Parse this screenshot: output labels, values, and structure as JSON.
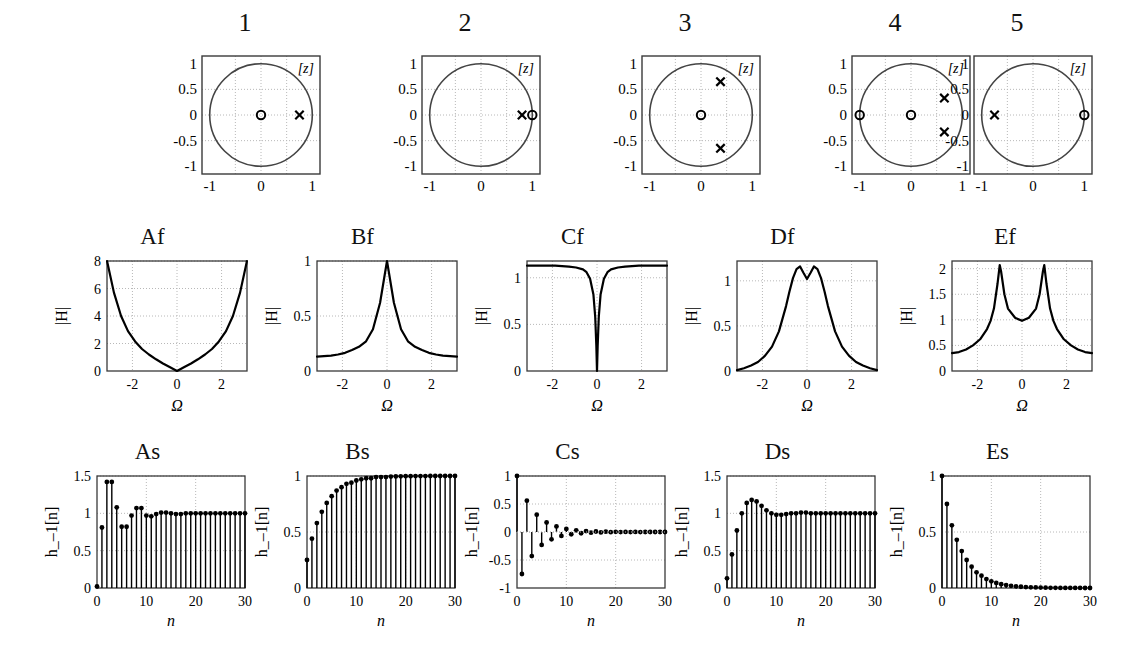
{
  "figure": {
    "rows": 3,
    "columns": 5
  },
  "row1": {
    "kind": "pole-zero",
    "axis": {
      "xticks": [
        "-1",
        "0",
        "1"
      ],
      "yticks": [
        "1",
        "0.5",
        "0",
        "-0.5",
        "-1"
      ],
      "plane_label": "[z]",
      "xlim": [
        -1.15,
        1.15
      ],
      "ylim": [
        -1.15,
        1.15
      ],
      "unit_circle": true,
      "grid": true
    },
    "panels": [
      {
        "title": "1",
        "zeros": [
          [
            0,
            0
          ]
        ],
        "poles": [
          [
            0.75,
            0
          ]
        ]
      },
      {
        "title": "2",
        "zeros": [
          [
            1.0,
            0
          ]
        ],
        "poles": [
          [
            0.8,
            0
          ]
        ]
      },
      {
        "title": "3",
        "zeros": [
          [
            0,
            0
          ]
        ],
        "poles": [
          [
            0.38,
            0.65
          ],
          [
            0.38,
            -0.65
          ]
        ]
      },
      {
        "title": "4",
        "zeros": [
          [
            -1.0,
            0
          ],
          [
            0,
            0
          ]
        ],
        "poles": [
          [
            0.65,
            0.33
          ],
          [
            0.65,
            -0.33
          ]
        ]
      },
      {
        "title": "5",
        "zeros": [
          [
            1.0,
            0
          ]
        ],
        "poles": [
          [
            -0.75,
            0
          ]
        ]
      }
    ]
  },
  "row2": {
    "kind": "magnitude-response",
    "ylabel": "|H|",
    "xlabel": "Ω",
    "xticks": [
      "-2",
      "0",
      "2"
    ],
    "xlim": [
      -3.1416,
      3.1416
    ],
    "panels": [
      {
        "title": "Af",
        "yticks": [
          "0",
          "2",
          "4",
          "6",
          "8"
        ],
        "ylim": [
          0,
          8
        ],
        "shape": "highpass",
        "chart_data": {
          "type": "line",
          "title": "Af",
          "xlabel": "Ω",
          "ylabel": "|H|",
          "xlim": [
            -3.1416,
            3.1416
          ],
          "ylim": [
            0,
            8
          ],
          "x": [
            -3.14,
            -2.83,
            -2.51,
            -2.2,
            -1.88,
            -1.57,
            -1.26,
            -0.94,
            -0.63,
            -0.31,
            0,
            0.31,
            0.63,
            0.94,
            1.26,
            1.57,
            1.88,
            2.2,
            2.51,
            2.83,
            3.14
          ],
          "y": [
            8.0,
            5.7,
            4.0,
            2.9,
            2.15,
            1.6,
            1.2,
            0.85,
            0.55,
            0.27,
            0.0,
            0.27,
            0.55,
            0.85,
            1.2,
            1.6,
            2.15,
            2.9,
            4.0,
            5.7,
            8.0
          ]
        }
      },
      {
        "title": "Bf",
        "yticks": [
          "0",
          "0.5",
          "1"
        ],
        "ylim": [
          0,
          1
        ],
        "shape": "lowpass",
        "chart_data": {
          "type": "line",
          "title": "Bf",
          "xlabel": "Ω",
          "ylabel": "|H|",
          "xlim": [
            -3.1416,
            3.1416
          ],
          "ylim": [
            0,
            1
          ],
          "x": [
            -3.14,
            -2.83,
            -2.51,
            -2.2,
            -1.88,
            -1.57,
            -1.26,
            -0.94,
            -0.63,
            -0.31,
            0,
            0.31,
            0.63,
            0.94,
            1.26,
            1.57,
            1.88,
            2.2,
            2.51,
            2.83,
            3.14
          ],
          "y": [
            0.13,
            0.135,
            0.14,
            0.15,
            0.165,
            0.19,
            0.22,
            0.27,
            0.38,
            0.62,
            1.0,
            0.62,
            0.38,
            0.27,
            0.22,
            0.19,
            0.165,
            0.15,
            0.14,
            0.135,
            0.13
          ]
        }
      },
      {
        "title": "Cf",
        "yticks": [
          "0",
          "0.5",
          "1"
        ],
        "ylim": [
          0,
          1.18
        ],
        "shape": "notch",
        "chart_data": {
          "type": "line",
          "title": "Cf",
          "xlabel": "Ω",
          "ylabel": "|H|",
          "xlim": [
            -3.1416,
            3.1416
          ],
          "ylim": [
            0,
            1.18
          ],
          "x": [
            -3.14,
            -2.51,
            -1.88,
            -1.26,
            -0.94,
            -0.63,
            -0.47,
            -0.31,
            -0.16,
            -0.08,
            -0.03,
            0,
            0.03,
            0.08,
            0.16,
            0.31,
            0.47,
            0.63,
            0.94,
            1.26,
            1.88,
            2.51,
            3.14
          ],
          "y": [
            1.13,
            1.13,
            1.13,
            1.12,
            1.11,
            1.09,
            1.06,
            0.99,
            0.82,
            0.58,
            0.27,
            0.0,
            0.27,
            0.58,
            0.82,
            0.99,
            1.06,
            1.09,
            1.11,
            1.12,
            1.13,
            1.13,
            1.13
          ]
        }
      },
      {
        "title": "Df",
        "yticks": [
          "0",
          "0.5",
          "1"
        ],
        "ylim": [
          0,
          1.22
        ],
        "shape": "bandpass-double",
        "chart_data": {
          "type": "line",
          "title": "Df",
          "xlabel": "Ω",
          "ylabel": "|H|",
          "xlim": [
            -3.1416,
            3.1416
          ],
          "ylim": [
            0,
            1.22
          ],
          "x": [
            -3.14,
            -2.83,
            -2.51,
            -2.2,
            -1.88,
            -1.57,
            -1.26,
            -0.94,
            -0.79,
            -0.63,
            -0.47,
            -0.31,
            -0.16,
            0,
            0.16,
            0.31,
            0.47,
            0.63,
            0.79,
            0.94,
            1.26,
            1.57,
            1.88,
            2.2,
            2.51,
            2.83,
            3.14
          ],
          "y": [
            0.01,
            0.03,
            0.06,
            0.1,
            0.17,
            0.27,
            0.44,
            0.72,
            0.88,
            1.03,
            1.13,
            1.16,
            1.09,
            1.02,
            1.09,
            1.16,
            1.13,
            1.03,
            0.88,
            0.72,
            0.44,
            0.27,
            0.17,
            0.1,
            0.06,
            0.03,
            0.01
          ]
        }
      },
      {
        "title": "Ef",
        "yticks": [
          "0",
          "0.5",
          "1",
          "1.5",
          "2"
        ],
        "ylim": [
          0,
          2.15
        ],
        "shape": "twin-peak",
        "chart_data": {
          "type": "line",
          "title": "Ef",
          "xlabel": "Ω",
          "ylabel": "|H|",
          "xlim": [
            -3.1416,
            3.1416
          ],
          "ylim": [
            0,
            2.15
          ],
          "x": [
            -3.14,
            -2.83,
            -2.51,
            -2.2,
            -1.88,
            -1.57,
            -1.41,
            -1.26,
            -1.1,
            -1.0,
            -0.94,
            -0.79,
            -0.63,
            -0.31,
            0,
            0.31,
            0.63,
            0.79,
            0.94,
            1.0,
            1.1,
            1.26,
            1.41,
            1.57,
            1.88,
            2.2,
            2.51,
            2.83,
            3.14
          ],
          "y": [
            0.35,
            0.37,
            0.42,
            0.5,
            0.62,
            0.82,
            0.98,
            1.22,
            1.7,
            2.07,
            1.95,
            1.5,
            1.22,
            1.04,
            0.98,
            1.04,
            1.22,
            1.5,
            1.95,
            2.07,
            1.7,
            1.22,
            0.98,
            0.82,
            0.62,
            0.5,
            0.42,
            0.37,
            0.35
          ]
        }
      }
    ]
  },
  "row3": {
    "kind": "step-response-stem",
    "ylabel": "h_–1[n]",
    "xlabel": "n",
    "xticks": [
      "0",
      "10",
      "20",
      "30"
    ],
    "xlim": [
      0,
      30
    ],
    "panels": [
      {
        "title": "As",
        "yticks": [
          "0",
          "0.5",
          "1",
          "1.5"
        ],
        "ylim": [
          0,
          1.5
        ],
        "chart_data": {
          "type": "stem",
          "title": "As",
          "xlabel": "n",
          "ylabel": "h_–1[n]",
          "xlim": [
            0,
            30
          ],
          "ylim": [
            0,
            1.5
          ],
          "x": [
            0,
            1,
            2,
            3,
            4,
            5,
            6,
            7,
            8,
            9,
            10,
            11,
            12,
            13,
            14,
            15,
            16,
            17,
            18,
            19,
            20,
            21,
            22,
            23,
            24,
            25,
            26,
            27,
            28,
            29,
            30
          ],
          "y": [
            0.02,
            0.81,
            1.42,
            1.42,
            1.08,
            0.82,
            0.82,
            0.97,
            1.07,
            1.07,
            0.97,
            0.96,
            0.99,
            1.01,
            1.01,
            1.0,
            0.99,
            0.99,
            1.0,
            1.0,
            1.0,
            1.0,
            1.0,
            1.0,
            1.0,
            1.0,
            1.0,
            1.0,
            1.0,
            1.0,
            1.0
          ]
        }
      },
      {
        "title": "Bs",
        "yticks": [
          "0",
          "0.5",
          "1"
        ],
        "ylim": [
          0,
          1.0
        ],
        "chart_data": {
          "type": "stem",
          "title": "Bs",
          "xlabel": "n",
          "ylabel": "h_–1[n]",
          "xlim": [
            0,
            30
          ],
          "ylim": [
            0,
            1.0
          ],
          "x": [
            0,
            1,
            2,
            3,
            4,
            5,
            6,
            7,
            8,
            9,
            10,
            11,
            12,
            13,
            14,
            15,
            16,
            17,
            18,
            19,
            20,
            21,
            22,
            23,
            24,
            25,
            26,
            27,
            28,
            29,
            30
          ],
          "y": [
            0.25,
            0.44,
            0.58,
            0.68,
            0.76,
            0.82,
            0.87,
            0.9,
            0.93,
            0.94,
            0.96,
            0.97,
            0.98,
            0.98,
            0.99,
            0.99,
            0.99,
            0.995,
            0.996,
            0.997,
            0.998,
            0.998,
            0.999,
            0.999,
            0.999,
            1.0,
            1.0,
            1.0,
            1.0,
            1.0,
            1.0
          ]
        }
      },
      {
        "title": "Cs",
        "yticks": [
          "-1",
          "-0.5",
          "0",
          "0.5",
          "1"
        ],
        "ylim": [
          -1,
          1
        ],
        "chart_data": {
          "type": "stem",
          "title": "Cs",
          "xlabel": "n",
          "ylabel": "h_–1[n]",
          "xlim": [
            0,
            30
          ],
          "ylim": [
            -1,
            1
          ],
          "x": [
            0,
            1,
            2,
            3,
            4,
            5,
            6,
            7,
            8,
            9,
            10,
            11,
            12,
            13,
            14,
            15,
            16,
            17,
            18,
            19,
            20,
            21,
            22,
            23,
            24,
            25,
            26,
            27,
            28,
            29,
            30
          ],
          "y": [
            1.0,
            -0.75,
            0.56,
            -0.43,
            0.31,
            -0.23,
            0.17,
            -0.13,
            0.1,
            -0.07,
            0.055,
            -0.04,
            0.03,
            -0.022,
            0.017,
            -0.012,
            0.009,
            -0.007,
            0.005,
            -0.004,
            0.003,
            -0.002,
            0.002,
            -0.001,
            0.001,
            -0.001,
            0.0,
            0.0,
            0.0,
            0.0,
            0.0
          ]
        }
      },
      {
        "title": "Ds",
        "yticks": [
          "0",
          "0.5",
          "1",
          "1.5"
        ],
        "ylim": [
          0,
          1.5
        ],
        "chart_data": {
          "type": "stem",
          "title": "Ds",
          "xlabel": "n",
          "ylabel": "h_–1[n]",
          "xlim": [
            0,
            30
          ],
          "ylim": [
            0,
            1.5
          ],
          "x": [
            0,
            1,
            2,
            3,
            4,
            5,
            6,
            7,
            8,
            9,
            10,
            11,
            12,
            13,
            14,
            15,
            16,
            17,
            18,
            19,
            20,
            21,
            22,
            23,
            24,
            25,
            26,
            27,
            28,
            29,
            30
          ],
          "y": [
            0.13,
            0.45,
            0.77,
            1.0,
            1.14,
            1.18,
            1.16,
            1.1,
            1.04,
            1.0,
            0.98,
            0.98,
            0.99,
            1.0,
            1.0,
            1.01,
            1.01,
            1.0,
            1.0,
            1.0,
            1.0,
            1.0,
            1.0,
            1.0,
            1.0,
            1.0,
            1.0,
            1.0,
            1.0,
            1.0,
            1.0
          ]
        }
      },
      {
        "title": "Es",
        "yticks": [
          "0",
          "0.5",
          "1"
        ],
        "ylim": [
          0,
          1.0
        ],
        "chart_data": {
          "type": "stem",
          "title": "Es",
          "xlabel": "n",
          "ylabel": "h_–1[n]",
          "xlim": [
            0,
            30
          ],
          "ylim": [
            0,
            1.0
          ],
          "x": [
            0,
            1,
            2,
            3,
            4,
            5,
            6,
            7,
            8,
            9,
            10,
            11,
            12,
            13,
            14,
            15,
            16,
            17,
            18,
            19,
            20,
            21,
            22,
            23,
            24,
            25,
            26,
            27,
            28,
            29,
            30
          ],
          "y": [
            1.0,
            0.75,
            0.56,
            0.43,
            0.33,
            0.25,
            0.19,
            0.14,
            0.11,
            0.08,
            0.06,
            0.045,
            0.034,
            0.026,
            0.019,
            0.015,
            0.011,
            0.008,
            0.006,
            0.005,
            0.004,
            0.003,
            0.002,
            0.0015,
            0.001,
            0.001,
            0.001,
            0.0005,
            0.0005,
            0.0,
            0.0
          ]
        }
      }
    ]
  },
  "colors": {
    "axis": "#3a3a3a",
    "curve": "#000000",
    "grid": "#b8b8b8",
    "circle": "#444444"
  }
}
